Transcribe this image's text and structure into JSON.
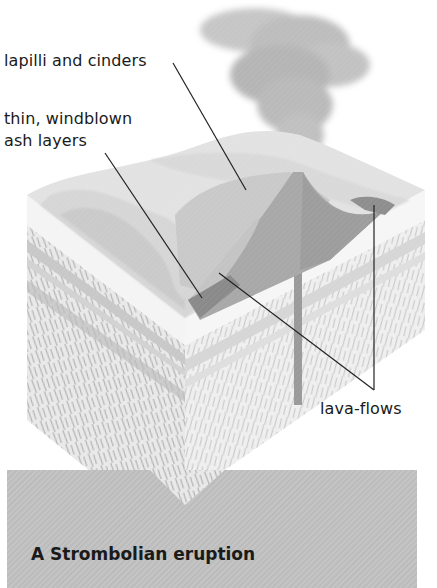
{
  "diagram": {
    "title": "A Strombolian eruption",
    "labels": {
      "lapilli": "lapilli and cinders",
      "ash_line1": "thin, windblown",
      "ash_line2": "ash layers",
      "lava": "lava-flows"
    },
    "colors": {
      "plume": "#b8b8b8",
      "surface_light": "#e4e4e4",
      "surface_mid": "#cfcfcf",
      "cone": "#a9a9a9",
      "cone_dark": "#8f8f8f",
      "lava_flow": "#7d7d7d",
      "strata": "#bdbdbd",
      "caption_bg": "#c0c0c0",
      "leader_line": "#222222"
    }
  }
}
